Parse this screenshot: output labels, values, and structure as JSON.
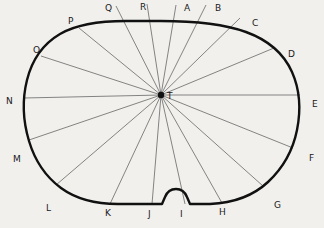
{
  "figure": {
    "background_color": "#f1f0ec",
    "outline_color": "#111111",
    "ray_color": "#6f6f6f",
    "center": {
      "label": "T",
      "x": 161,
      "y": 95,
      "marker": "center-dot"
    },
    "outline_path": "M 161 21 C 196 21 224 24 246 32 C 268 40 284 54 292 72 C 300 90 301 110 297 130 C 293 150 283 168 268 182 C 253 196 233 203 210 204 L 190 204 L 187 197 C 185 192 181 189 176 189 C 171 189 167 192 165 197 L 162 204 L 118 204 C 96 204 76 199 61 188 C 46 177 35 161 29 141 C 23 121 22 100 27 80 C 32 60 43 44 60 34 C 77 24 99 21 126 21 Z",
    "notch": {
      "name": "bottom-notch",
      "description": "small upward bump on lower border"
    },
    "rays": [
      {
        "label": "A",
        "edge_x": 179,
        "edge_y": 21,
        "label_x": 184,
        "label_y": 11,
        "tick_x": 176,
        "tick_y": 5
      },
      {
        "label": "B",
        "edge_x": 207,
        "edge_y": 23,
        "label_x": 215,
        "label_y": 11,
        "tick_x": 206,
        "tick_y": 5
      },
      {
        "label": "C",
        "edge_x": 243,
        "edge_y": 31,
        "label_x": 252,
        "label_y": 26,
        "tick_x": 240,
        "tick_y": 18
      },
      {
        "label": "D",
        "edge_x": 278,
        "edge_y": 56,
        "label_x": 288,
        "label_y": 57,
        "tick_x": 274,
        "tick_y": 48
      },
      {
        "label": "E",
        "edge_x": 300,
        "edge_y": 102,
        "label_x": 312,
        "label_y": 107,
        "tick_x": 300,
        "tick_y": 95
      },
      {
        "label": "F",
        "edge_x": 295,
        "edge_y": 150,
        "label_x": 309,
        "label_y": 161,
        "tick_x": 293,
        "tick_y": 148
      },
      {
        "label": "G",
        "edge_x": 266,
        "edge_y": 187,
        "label_x": 274,
        "label_y": 208,
        "tick_x": 263,
        "tick_y": 186
      },
      {
        "label": "H",
        "edge_x": 223,
        "edge_y": 203,
        "label_x": 219,
        "label_y": 215,
        "tick_x": 222,
        "tick_y": 203
      },
      {
        "label": "I",
        "edge_x": 185,
        "edge_y": 204,
        "label_x": 180,
        "label_y": 217,
        "tick_x": 185,
        "tick_y": 204
      },
      {
        "label": "J",
        "edge_x": 152,
        "edge_y": 204,
        "label_x": 148,
        "label_y": 217,
        "tick_x": 152,
        "tick_y": 204
      },
      {
        "label": "K",
        "edge_x": 110,
        "edge_y": 204,
        "label_x": 105,
        "label_y": 216,
        "tick_x": 110,
        "tick_y": 204
      },
      {
        "label": "L",
        "edge_x": 57,
        "edge_y": 185,
        "label_x": 46,
        "label_y": 211,
        "tick_x": 56,
        "tick_y": 185
      },
      {
        "label": "M",
        "edge_x": 28,
        "edge_y": 139,
        "label_x": 13,
        "label_y": 162,
        "tick_x": 29,
        "tick_y": 140
      },
      {
        "label": "N",
        "edge_x": 23,
        "edge_y": 98,
        "label_x": 6,
        "label_y": 104,
        "tick_x": 24,
        "tick_y": 98
      },
      {
        "label": "O",
        "edge_x": 39,
        "edge_y": 55,
        "label_x": 33,
        "label_y": 53,
        "tick_x": 41,
        "tick_y": 56
      },
      {
        "label": "P",
        "edge_x": 78,
        "edge_y": 28,
        "label_x": 68,
        "label_y": 24,
        "tick_x": 79,
        "tick_y": 28
      },
      {
        "label": "Q",
        "edge_x": 118,
        "edge_y": 21,
        "label_x": 105,
        "label_y": 11,
        "tick_x": 116,
        "tick_y": 6
      },
      {
        "label": "R",
        "edge_x": 149,
        "edge_y": 21,
        "label_x": 140,
        "label_y": 10,
        "tick_x": 147,
        "tick_y": 4
      }
    ]
  }
}
